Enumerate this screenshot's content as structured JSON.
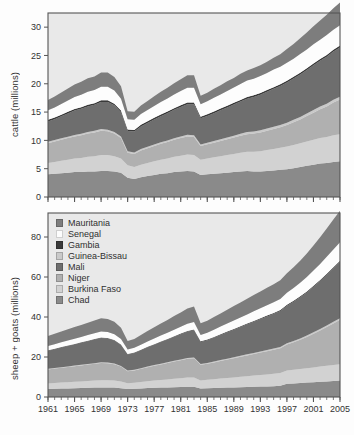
{
  "figure": {
    "kind": "two-panel stacked area chart",
    "background_color": "#ffffff",
    "plot_background_color": "#e9e9e9",
    "frame_color": "#555555"
  },
  "legend": {
    "position": "inside bottom panel, upper left",
    "entries": [
      {
        "label": "Mauritania",
        "color": "#7d7d7d"
      },
      {
        "label": "Senegal",
        "color": "#fdfdfd"
      },
      {
        "label": "Gambia",
        "color": "#3a3a3a"
      },
      {
        "label": "Guinea-Bissau",
        "color": "#c9c9c9"
      },
      {
        "label": "Mali",
        "color": "#6e6e6e"
      },
      {
        "label": "Niger",
        "color": "#b0b0b0"
      },
      {
        "label": "Burkina Faso",
        "color": "#d2d2d2"
      },
      {
        "label": "Chad",
        "color": "#8a8a8a"
      }
    ]
  },
  "chart_data": [
    {
      "id": "cattle",
      "type": "area",
      "stacked": true,
      "title": "",
      "xlabel": "",
      "ylabel": "cattle (millions)",
      "xlim": [
        1961,
        2005
      ],
      "ylim": [
        0,
        32.5
      ],
      "yticks": [
        0,
        5,
        10,
        15,
        20,
        25,
        30
      ],
      "ytick_labels": [
        "0",
        "5",
        "10",
        "15",
        "20",
        "25",
        "30"
      ],
      "xticks": [
        1961,
        1965,
        1969,
        1973,
        1977,
        1981,
        1985,
        1989,
        1993,
        1997,
        2001,
        2005
      ],
      "xtick_labels": [
        "1961",
        "1965",
        "1969",
        "1973",
        "1977",
        "1981",
        "1985",
        "1989",
        "1993",
        "1997",
        "2001",
        "2005"
      ],
      "minor_xticks_every": 1,
      "grid": false,
      "x": [
        1961,
        1962,
        1963,
        1964,
        1965,
        1966,
        1967,
        1968,
        1969,
        1970,
        1971,
        1972,
        1973,
        1974,
        1975,
        1976,
        1977,
        1978,
        1979,
        1980,
        1981,
        1982,
        1983,
        1984,
        1985,
        1986,
        1987,
        1988,
        1989,
        1990,
        1991,
        1992,
        1993,
        1994,
        1995,
        1996,
        1997,
        1998,
        1999,
        2000,
        2001,
        2002,
        2003,
        2004,
        2005
      ],
      "stack_order_bottom_to_top": [
        "Chad",
        "Burkina Faso",
        "Niger",
        "Guinea-Bissau",
        "Mali",
        "Gambia",
        "Senegal",
        "Mauritania"
      ],
      "series": [
        {
          "name": "Chad",
          "color": "#8a8a8a",
          "values": [
            4.0,
            4.1,
            4.2,
            4.3,
            4.4,
            4.4,
            4.5,
            4.5,
            4.6,
            4.6,
            4.5,
            4.3,
            3.4,
            3.2,
            3.5,
            3.7,
            3.9,
            4.1,
            4.2,
            4.4,
            4.5,
            4.6,
            4.5,
            3.9,
            4.0,
            4.1,
            4.2,
            4.3,
            4.4,
            4.5,
            4.6,
            4.5,
            4.5,
            4.6,
            4.7,
            4.8,
            4.9,
            5.1,
            5.3,
            5.5,
            5.7,
            5.9,
            6.0,
            6.2,
            6.3
          ]
        },
        {
          "name": "Burkina Faso",
          "color": "#d2d2d2",
          "values": [
            2.0,
            2.1,
            2.2,
            2.3,
            2.4,
            2.5,
            2.6,
            2.7,
            2.8,
            2.8,
            2.7,
            2.5,
            2.2,
            2.1,
            2.2,
            2.3,
            2.4,
            2.5,
            2.6,
            2.7,
            2.8,
            2.9,
            2.9,
            2.7,
            2.8,
            2.9,
            3.0,
            3.1,
            3.2,
            3.3,
            3.4,
            3.5,
            3.6,
            3.7,
            3.8,
            3.9,
            4.0,
            4.1,
            4.2,
            4.3,
            4.4,
            4.5,
            4.6,
            4.7,
            4.8
          ]
        },
        {
          "name": "Niger",
          "color": "#b0b0b0",
          "values": [
            3.5,
            3.6,
            3.7,
            3.8,
            3.9,
            4.0,
            4.1,
            4.2,
            4.3,
            4.2,
            4.0,
            3.6,
            2.2,
            2.3,
            2.5,
            2.6,
            2.7,
            2.8,
            2.9,
            3.0,
            3.1,
            3.2,
            3.2,
            2.4,
            2.5,
            2.6,
            2.7,
            2.8,
            2.9,
            3.0,
            3.1,
            3.2,
            3.3,
            3.4,
            3.5,
            3.6,
            3.8,
            4.0,
            4.2,
            4.5,
            4.8,
            5.1,
            5.4,
            5.8,
            6.1
          ]
        },
        {
          "name": "Guinea-Bissau",
          "color": "#c9c9c9",
          "values": [
            0.25,
            0.25,
            0.26,
            0.26,
            0.27,
            0.27,
            0.28,
            0.28,
            0.29,
            0.29,
            0.29,
            0.28,
            0.26,
            0.26,
            0.27,
            0.27,
            0.28,
            0.28,
            0.29,
            0.29,
            0.3,
            0.3,
            0.3,
            0.29,
            0.3,
            0.31,
            0.32,
            0.33,
            0.34,
            0.35,
            0.36,
            0.37,
            0.38,
            0.39,
            0.4,
            0.41,
            0.42,
            0.43,
            0.44,
            0.45,
            0.46,
            0.47,
            0.48,
            0.49,
            0.5
          ]
        },
        {
          "name": "Mali",
          "color": "#6e6e6e",
          "values": [
            3.6,
            3.7,
            3.9,
            4.1,
            4.3,
            4.4,
            4.5,
            4.6,
            4.8,
            4.9,
            4.7,
            4.3,
            3.6,
            3.7,
            4.0,
            4.2,
            4.4,
            4.6,
            4.8,
            5.0,
            5.2,
            5.4,
            5.5,
            4.6,
            4.7,
            4.9,
            5.1,
            5.3,
            5.5,
            5.7,
            5.9,
            6.1,
            6.3,
            6.5,
            6.7,
            6.9,
            7.1,
            7.3,
            7.5,
            7.7,
            7.9,
            8.1,
            8.3,
            8.5,
            8.7
          ]
        },
        {
          "name": "Gambia",
          "color": "#3a3a3a",
          "values": [
            0.28,
            0.28,
            0.28,
            0.29,
            0.29,
            0.29,
            0.3,
            0.3,
            0.3,
            0.3,
            0.3,
            0.29,
            0.28,
            0.28,
            0.29,
            0.29,
            0.3,
            0.3,
            0.3,
            0.3,
            0.31,
            0.31,
            0.31,
            0.3,
            0.3,
            0.3,
            0.3,
            0.3,
            0.3,
            0.3,
            0.3,
            0.3,
            0.3,
            0.3,
            0.3,
            0.3,
            0.3,
            0.3,
            0.3,
            0.3,
            0.31,
            0.31,
            0.32,
            0.33,
            0.34
          ]
        },
        {
          "name": "Senegal",
          "color": "#fdfdfd",
          "values": [
            1.7,
            1.8,
            1.9,
            2.0,
            2.1,
            2.2,
            2.3,
            2.3,
            2.4,
            2.4,
            2.3,
            2.1,
            1.8,
            1.8,
            1.9,
            2.0,
            2.1,
            2.2,
            2.3,
            2.4,
            2.5,
            2.6,
            2.6,
            2.2,
            2.3,
            2.4,
            2.5,
            2.6,
            2.7,
            2.8,
            2.9,
            2.9,
            3.0,
            3.0,
            3.1,
            3.1,
            3.2,
            3.2,
            3.3,
            3.3,
            3.4,
            3.4,
            3.5,
            3.5,
            3.6
          ]
        },
        {
          "name": "Mauritania",
          "color": "#7d7d7d",
          "values": [
            1.8,
            1.9,
            2.0,
            2.1,
            2.2,
            2.3,
            2.4,
            2.4,
            2.5,
            2.5,
            2.4,
            2.2,
            1.4,
            1.4,
            1.5,
            1.6,
            1.7,
            1.8,
            1.9,
            2.0,
            2.1,
            2.2,
            2.2,
            1.5,
            1.5,
            1.6,
            1.6,
            1.7,
            1.7,
            1.8,
            1.8,
            1.9,
            1.9,
            2.0,
            2.1,
            2.2,
            2.4,
            2.6,
            2.8,
            3.0,
            3.2,
            3.4,
            3.6,
            3.8,
            4.0
          ]
        }
      ],
      "annotations": [
        "Sharp drop in 1973-74 (Sahel drought)",
        "Sharp drop in 1984-85 (Sahel drought)"
      ]
    },
    {
      "id": "sheep_goats",
      "type": "area",
      "stacked": true,
      "title": "",
      "xlabel": "",
      "ylabel": "sheep + goats (millions)",
      "xlim": [
        1961,
        2005
      ],
      "ylim": [
        0,
        92
      ],
      "yticks": [
        0,
        20,
        40,
        60,
        80
      ],
      "ytick_labels": [
        "0",
        "20",
        "40",
        "60",
        "80"
      ],
      "xticks": [
        1961,
        1965,
        1969,
        1973,
        1977,
        1981,
        1985,
        1989,
        1993,
        1997,
        2001,
        2005
      ],
      "xtick_labels": [
        "1961",
        "1965",
        "1969",
        "1973",
        "1977",
        "1981",
        "1985",
        "1989",
        "1993",
        "1997",
        "2001",
        "2005"
      ],
      "minor_xticks_every": 1,
      "grid": false,
      "x": [
        1961,
        1962,
        1963,
        1964,
        1965,
        1966,
        1967,
        1968,
        1969,
        1970,
        1971,
        1972,
        1973,
        1974,
        1975,
        1976,
        1977,
        1978,
        1979,
        1980,
        1981,
        1982,
        1983,
        1984,
        1985,
        1986,
        1987,
        1988,
        1989,
        1990,
        1991,
        1992,
        1993,
        1994,
        1995,
        1996,
        1997,
        1998,
        1999,
        2000,
        2001,
        2002,
        2003,
        2004,
        2005
      ],
      "stack_order_bottom_to_top": [
        "Chad",
        "Burkina Faso",
        "Niger",
        "Guinea-Bissau",
        "Mali",
        "Gambia",
        "Senegal",
        "Mauritania"
      ],
      "series": [
        {
          "name": "Chad",
          "color": "#8a8a8a",
          "values": [
            4.0,
            4.1,
            4.2,
            4.3,
            4.4,
            4.5,
            4.6,
            4.7,
            4.8,
            4.8,
            4.7,
            4.4,
            4.0,
            4.1,
            4.3,
            4.5,
            4.6,
            4.7,
            4.8,
            4.9,
            5.0,
            5.1,
            5.1,
            4.3,
            4.4,
            4.5,
            4.6,
            4.7,
            4.8,
            4.9,
            5.0,
            5.1,
            5.2,
            5.3,
            5.4,
            5.6,
            6.6,
            6.8,
            7.0,
            7.2,
            7.4,
            7.6,
            7.8,
            8.0,
            8.2
          ]
        },
        {
          "name": "Burkina Faso",
          "color": "#d2d2d2",
          "values": [
            2.8,
            2.9,
            3.0,
            3.1,
            3.2,
            3.3,
            3.4,
            3.5,
            3.6,
            3.6,
            3.5,
            3.3,
            2.9,
            3.0,
            3.2,
            3.4,
            3.6,
            3.8,
            4.0,
            4.2,
            4.4,
            4.6,
            4.7,
            4.0,
            4.2,
            4.4,
            4.6,
            4.8,
            5.0,
            5.2,
            5.4,
            5.6,
            5.8,
            6.0,
            6.2,
            6.4,
            6.6,
            6.8,
            7.0,
            7.2,
            7.4,
            7.6,
            7.8,
            8.0,
            8.2
          ]
        },
        {
          "name": "Niger",
          "color": "#b0b0b0",
          "values": [
            7.0,
            7.2,
            7.4,
            7.6,
            7.8,
            8.0,
            8.2,
            8.4,
            8.6,
            8.5,
            8.2,
            7.5,
            6.0,
            6.2,
            6.6,
            7.0,
            7.4,
            7.8,
            8.2,
            8.6,
            9.0,
            9.4,
            9.6,
            7.8,
            8.0,
            8.4,
            8.8,
            9.2,
            9.6,
            10.0,
            10.4,
            10.8,
            11.2,
            11.6,
            12.0,
            12.4,
            13.0,
            13.8,
            14.6,
            15.6,
            16.8,
            18.0,
            19.4,
            20.8,
            22.2
          ]
        },
        {
          "name": "Guinea-Bissau",
          "color": "#c9c9c9",
          "values": [
            0.3,
            0.3,
            0.31,
            0.31,
            0.32,
            0.32,
            0.33,
            0.33,
            0.34,
            0.34,
            0.34,
            0.33,
            0.31,
            0.32,
            0.33,
            0.34,
            0.35,
            0.36,
            0.37,
            0.38,
            0.39,
            0.4,
            0.41,
            0.4,
            0.41,
            0.42,
            0.44,
            0.46,
            0.48,
            0.5,
            0.52,
            0.54,
            0.56,
            0.58,
            0.6,
            0.62,
            0.64,
            0.66,
            0.68,
            0.7,
            0.72,
            0.74,
            0.76,
            0.78,
            0.8
          ]
        },
        {
          "name": "Mali",
          "color": "#6e6e6e",
          "values": [
            9.0,
            9.4,
            9.8,
            10.2,
            10.6,
            11.0,
            11.4,
            11.8,
            12.2,
            12.0,
            11.5,
            10.5,
            8.0,
            8.4,
            9.0,
            9.6,
            10.2,
            10.8,
            11.4,
            12.0,
            12.6,
            13.2,
            13.6,
            11.0,
            11.4,
            12.0,
            12.6,
            13.2,
            13.8,
            14.4,
            15.0,
            15.6,
            16.2,
            16.8,
            17.4,
            18.0,
            18.8,
            19.6,
            20.6,
            21.6,
            22.8,
            24.0,
            25.4,
            26.8,
            28.2
          ]
        },
        {
          "name": "Gambia",
          "color": "#3a3a3a",
          "values": [
            0.22,
            0.22,
            0.23,
            0.23,
            0.24,
            0.24,
            0.25,
            0.25,
            0.26,
            0.26,
            0.26,
            0.25,
            0.24,
            0.24,
            0.25,
            0.26,
            0.27,
            0.28,
            0.29,
            0.3,
            0.31,
            0.32,
            0.33,
            0.32,
            0.33,
            0.34,
            0.35,
            0.36,
            0.37,
            0.38,
            0.39,
            0.4,
            0.41,
            0.42,
            0.43,
            0.44,
            0.45,
            0.46,
            0.47,
            0.48,
            0.49,
            0.5,
            0.51,
            0.52,
            0.53
          ]
        },
        {
          "name": "Senegal",
          "color": "#fdfdfd",
          "values": [
            2.2,
            2.3,
            2.4,
            2.5,
            2.6,
            2.7,
            2.8,
            2.9,
            3.0,
            3.0,
            2.9,
            2.7,
            2.3,
            2.4,
            2.5,
            2.7,
            2.8,
            3.0,
            3.1,
            3.3,
            3.4,
            3.6,
            3.7,
            3.2,
            3.4,
            3.6,
            3.8,
            4.0,
            4.2,
            4.4,
            4.6,
            4.8,
            5.0,
            5.2,
            5.4,
            5.6,
            6.0,
            6.4,
            6.8,
            7.2,
            7.6,
            8.0,
            8.4,
            8.8,
            9.2
          ]
        },
        {
          "name": "Mauritania",
          "color": "#7d7d7d",
          "values": [
            5.0,
            5.2,
            5.4,
            5.6,
            5.8,
            6.0,
            6.2,
            6.4,
            6.6,
            6.5,
            6.2,
            5.6,
            4.2,
            4.4,
            4.8,
            5.2,
            5.6,
            6.0,
            6.4,
            6.8,
            7.2,
            7.6,
            7.8,
            5.8,
            6.0,
            6.3,
            6.6,
            6.9,
            7.2,
            7.5,
            7.8,
            8.1,
            8.4,
            8.7,
            9.0,
            9.3,
            9.8,
            10.4,
            11.0,
            11.8,
            12.6,
            13.4,
            14.2,
            15.0,
            15.8
          ]
        }
      ],
      "annotations": [
        "Sharp drop in 1973-74 (Sahel drought)",
        "Sharp drop in 1984-85 (Sahel drought)"
      ]
    }
  ]
}
